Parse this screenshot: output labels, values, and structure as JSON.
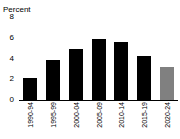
{
  "chart_data": {
    "type": "bar",
    "title": "",
    "subtitle": "",
    "xlabel": "",
    "ylabel": "Percent",
    "categories": [
      "1990-94",
      "1995-99",
      "2000-04",
      "2005-09",
      "2010-14",
      "2015-19",
      "2020-24"
    ],
    "values": [
      2.1,
      3.9,
      4.9,
      5.9,
      5.6,
      4.2,
      3.2
    ],
    "bar_colors": [
      "#000000",
      "#000000",
      "#000000",
      "#000000",
      "#000000",
      "#000000",
      "#808080"
    ],
    "ylim": [
      0,
      8
    ],
    "ytick_labels": [
      "8",
      "6",
      "4",
      "2",
      "0"
    ],
    "ytick_values": [
      8,
      6,
      4,
      2,
      0
    ],
    "grid": false,
    "legend": "none",
    "xtick_rotation": 90
  },
  "style": {
    "background": "#ffffff",
    "axis_color": "#000000",
    "primary_bar_color": "#000000",
    "highlight_bar_color": "#808080"
  }
}
